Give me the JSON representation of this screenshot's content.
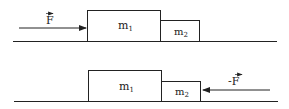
{
  "diagram": {
    "top_scene": {
      "force_label": "F",
      "force_direction": "right",
      "mass1_label": "m",
      "mass1_sub": "1",
      "mass2_label": "m",
      "mass2_sub": "2"
    },
    "bottom_scene": {
      "force_label": "-F",
      "force_direction": "left",
      "mass1_label": "m",
      "mass1_sub": "1",
      "mass2_label": "m",
      "mass2_sub": "2"
    },
    "colors": {
      "stroke": "#222222",
      "background": "#ffffff"
    }
  }
}
